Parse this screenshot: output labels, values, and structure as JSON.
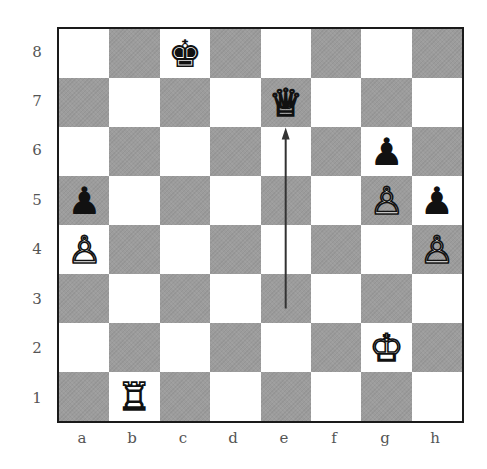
{
  "diagram": {
    "type": "chess-position",
    "ranks": [
      "8",
      "7",
      "6",
      "5",
      "4",
      "3",
      "2",
      "1"
    ],
    "files": [
      "a",
      "b",
      "c",
      "d",
      "e",
      "f",
      "g",
      "h"
    ],
    "colors": {
      "light_square": "#ffffff",
      "dark_square": "#9c9c9c",
      "border": "#1a1a1a",
      "arrow": "#333333",
      "label": "#555555"
    },
    "pieces": [
      {
        "square": "c8",
        "color": "black",
        "type": "king",
        "glyph": "♚"
      },
      {
        "square": "e7",
        "color": "white",
        "type": "queen",
        "glyph": "♕"
      },
      {
        "square": "g6",
        "color": "black",
        "type": "pawn",
        "glyph": "♟"
      },
      {
        "square": "a5",
        "color": "black",
        "type": "pawn",
        "glyph": "♟"
      },
      {
        "square": "g5",
        "color": "white",
        "type": "pawn",
        "glyph": "♙"
      },
      {
        "square": "h5",
        "color": "black",
        "type": "pawn",
        "glyph": "♟"
      },
      {
        "square": "a4",
        "color": "white",
        "type": "pawn",
        "glyph": "♙"
      },
      {
        "square": "h4",
        "color": "white",
        "type": "pawn",
        "glyph": "♙"
      },
      {
        "square": "g2",
        "color": "white",
        "type": "king",
        "glyph": "♔"
      },
      {
        "square": "b1",
        "color": "white",
        "type": "rook",
        "glyph": "♖"
      }
    ],
    "arrows": [
      {
        "from": "e3",
        "to": "e7"
      }
    ]
  }
}
